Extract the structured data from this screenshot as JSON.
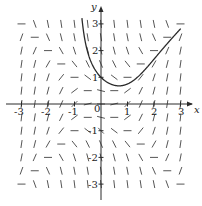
{
  "diagram": {
    "type": "slope-field",
    "equation_hint": "dy/dx = x^2 - y^2",
    "x_axis_label": "x",
    "y_axis_label": "y",
    "x_ticks": [
      {
        "value": -3,
        "label": "-3"
      },
      {
        "value": -2,
        "label": "-2"
      },
      {
        "value": -1,
        "label": "-1"
      },
      {
        "value": 0,
        "label": "0"
      },
      {
        "value": 1,
        "label": "1"
      },
      {
        "value": 2,
        "label": "2"
      },
      {
        "value": 3,
        "label": "3"
      }
    ],
    "y_ticks": [
      {
        "value": 3,
        "label": "3"
      },
      {
        "value": 2,
        "label": "2"
      },
      {
        "value": 1,
        "label": "1"
      },
      {
        "value": -1,
        "label": "-1"
      },
      {
        "value": -2,
        "label": "-2"
      },
      {
        "value": -3,
        "label": "-3"
      }
    ],
    "xlim": [
      -3,
      3
    ],
    "ylim": [
      -3,
      3
    ],
    "grid_step": 0.5,
    "solution_curve": {
      "description": "solution through (0,1)",
      "initial_point": [
        0,
        1
      ]
    },
    "colors": {
      "ink": "#2a2a2a",
      "background": "#ffffff"
    }
  }
}
